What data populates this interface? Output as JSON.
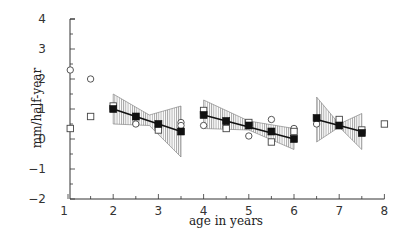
{
  "chart_data": {
    "type": "scatter",
    "title": "",
    "xlabel": "age in years",
    "ylabel": "mm/half-year",
    "xlim": [
      1,
      8
    ],
    "ylim": [
      -2,
      4
    ],
    "x_ticks": [
      "1",
      "2",
      "3",
      "4",
      "5",
      "6",
      "7",
      "8"
    ],
    "y_ticks": [
      "4",
      "3",
      "2",
      "1",
      "0",
      "−1",
      "−2"
    ],
    "grid": false,
    "legend": null,
    "series": [
      {
        "name": "open circles",
        "marker": "circle-open",
        "points": [
          [
            1.05,
            2.3
          ],
          [
            1.5,
            2.0
          ],
          [
            2.5,
            0.5
          ],
          [
            3.0,
            0.35
          ],
          [
            3.5,
            0.55
          ],
          [
            3.5,
            0.45
          ],
          [
            4.0,
            0.45
          ],
          [
            4.5,
            0.4
          ],
          [
            5.0,
            0.1
          ],
          [
            5.5,
            0.65
          ],
          [
            6.0,
            0.35
          ],
          [
            6.5,
            0.5
          ],
          [
            7.0,
            0.6
          ]
        ]
      },
      {
        "name": "open squares",
        "marker": "square-open",
        "points": [
          [
            1.05,
            0.35
          ],
          [
            1.5,
            0.75
          ],
          [
            2.0,
            1.1
          ],
          [
            3.0,
            0.3
          ],
          [
            4.0,
            0.95
          ],
          [
            4.5,
            0.35
          ],
          [
            5.0,
            0.55
          ],
          [
            5.5,
            -0.1
          ],
          [
            6.0,
            0.25
          ],
          [
            7.0,
            0.65
          ],
          [
            7.5,
            0.3
          ],
          [
            8.0,
            0.5
          ]
        ]
      },
      {
        "name": "filled squares (means)",
        "marker": "square-filled",
        "points": [
          [
            2.0,
            1.0
          ],
          [
            2.5,
            0.75
          ],
          [
            3.0,
            0.5
          ],
          [
            3.5,
            0.25
          ],
          [
            4.0,
            0.8
          ],
          [
            4.5,
            0.6
          ],
          [
            5.0,
            0.45
          ],
          [
            5.5,
            0.25
          ],
          [
            6.0,
            0.0
          ],
          [
            6.5,
            0.7
          ],
          [
            7.0,
            0.45
          ],
          [
            7.5,
            0.2
          ]
        ]
      }
    ],
    "regression_segments": [
      {
        "x": [
          2.0,
          3.5
        ],
        "y": [
          1.0,
          0.25
        ],
        "band_upper": [
          1.5,
          0.65,
          1.1
        ],
        "band_lower": [
          0.5,
          0.2,
          -0.6
        ],
        "band_x": [
          2.0,
          3.0,
          3.5
        ]
      },
      {
        "x": [
          4.0,
          6.0
        ],
        "y": [
          0.8,
          0.0
        ],
        "band_upper": [
          1.2,
          0.45,
          0.3
        ],
        "band_lower": [
          0.4,
          0.45,
          -0.35
        ],
        "band_x": [
          4.0,
          5.0,
          6.0
        ]
      },
      {
        "x": [
          6.5,
          7.5
        ],
        "y": [
          0.65,
          0.25
        ],
        "band_upper": [
          1.4,
          0.85
        ],
        "band_lower": [
          -0.1,
          -0.35
        ],
        "band_x": [
          6.5,
          7.5
        ],
        "band_mid": [
          7.0,
          0.45
        ]
      }
    ]
  },
  "labels": {
    "xlabel": "age in years",
    "ylabel": "mm/half-year",
    "x_ticks": [
      "1",
      "2",
      "3",
      "4",
      "5",
      "6",
      "7",
      "8"
    ],
    "y_ticks": [
      "4",
      "3",
      "2",
      "1",
      "0",
      "−1",
      "−2"
    ]
  }
}
